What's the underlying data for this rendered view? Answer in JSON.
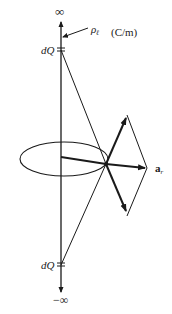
{
  "labels": {
    "top_infinity": "∞",
    "bottom_infinity": "−∞",
    "line_charge": "ρ",
    "line_charge_sub": "ℓ",
    "units": "(C/m)",
    "dq_top": "dQ",
    "dq_bottom": "dQ",
    "unit_vector": "a",
    "unit_vector_sub": "r"
  },
  "colors": {
    "stroke": "#1a1a1a",
    "background": "#ffffff"
  }
}
